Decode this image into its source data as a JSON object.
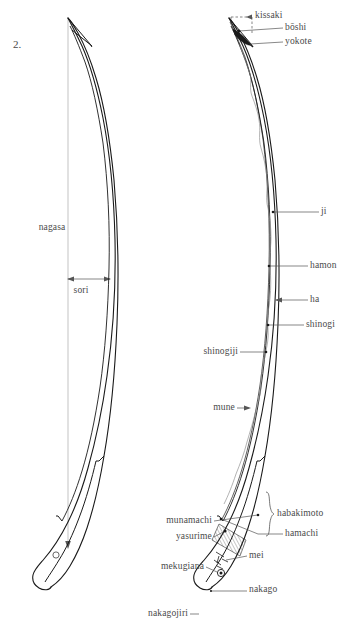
{
  "figure": {
    "number": "2.",
    "caption": ""
  },
  "left_blade": {
    "name": "sword-silhouette-unlabeled",
    "measurements": [
      {
        "key": "nagasa",
        "label": "nagasa",
        "x": 52,
        "y": 228,
        "align": "c"
      },
      {
        "key": "sori",
        "label": "sori",
        "x": 81,
        "y": 291,
        "align": "c"
      }
    ]
  },
  "right_blade": {
    "name": "sword-silhouette-labeled",
    "labels": [
      {
        "key": "kissaki",
        "label": "kissaki",
        "x": 255,
        "y": 16,
        "align": "l"
      },
      {
        "key": "boshi",
        "label": "bōshi",
        "x": 285,
        "y": 28,
        "align": "l"
      },
      {
        "key": "yokote",
        "label": "yokote",
        "x": 285,
        "y": 42,
        "align": "l"
      },
      {
        "key": "ji",
        "label": "ji",
        "x": 321,
        "y": 212,
        "align": "l"
      },
      {
        "key": "hamon",
        "label": "hamon",
        "x": 310,
        "y": 266,
        "align": "l"
      },
      {
        "key": "ha",
        "label": "ha",
        "x": 310,
        "y": 300,
        "align": "l"
      },
      {
        "key": "shinogi",
        "label": "shinogi",
        "x": 306,
        "y": 325,
        "align": "l"
      },
      {
        "key": "shinogiji",
        "label": "shinogiji",
        "x": 238,
        "y": 352,
        "align": "r"
      },
      {
        "key": "mune",
        "label": "mune",
        "x": 235,
        "y": 408,
        "align": "r"
      },
      {
        "key": "habakimoto",
        "label": "habakimoto",
        "x": 275,
        "y": 514,
        "align": "l"
      },
      {
        "key": "munamachi",
        "label": "munamachi",
        "x": 212,
        "y": 521,
        "align": "r"
      },
      {
        "key": "hamachi",
        "label": "hamachi",
        "x": 285,
        "y": 534,
        "align": "l"
      },
      {
        "key": "yasurime",
        "label": "yasurime",
        "x": 212,
        "y": 537,
        "align": "r"
      },
      {
        "key": "mei",
        "label": "mei",
        "x": 249,
        "y": 556,
        "align": "l"
      },
      {
        "key": "mekugiana",
        "label": "mekugiana",
        "x": 204,
        "y": 567,
        "align": "r"
      },
      {
        "key": "nakago",
        "label": "nakago",
        "x": 249,
        "y": 590,
        "align": "l"
      },
      {
        "key": "nakagojiri",
        "label": "nakagojiri",
        "x": 188,
        "y": 614,
        "align": "r"
      }
    ]
  },
  "colors": {
    "ink": "#1a1a1a",
    "hairline": "#7a7a7a",
    "leader": "#555555",
    "text": "#4a4a4a",
    "background": "#ffffff"
  }
}
